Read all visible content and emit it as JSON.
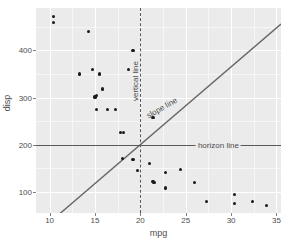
{
  "chart_data": {
    "type": "scatter",
    "title": "",
    "xlabel": "mpg",
    "ylabel": "disp",
    "xlim": [
      8.5,
      35.5
    ],
    "ylim": [
      55,
      490
    ],
    "grid": true,
    "legend": false,
    "x_ticks": [
      10,
      15,
      20,
      25,
      30,
      35
    ],
    "y_ticks": [
      100,
      200,
      300,
      400
    ],
    "x_minor_ticks": [
      12.5,
      17.5,
      22.5,
      27.5,
      32.5
    ],
    "y_minor_ticks": [
      150,
      250,
      350,
      450
    ],
    "points": [
      {
        "x": 10.4,
        "y": 472
      },
      {
        "x": 10.4,
        "y": 460
      },
      {
        "x": 14.3,
        "y": 440
      },
      {
        "x": 19.2,
        "y": 400
      },
      {
        "x": 13.3,
        "y": 350
      },
      {
        "x": 14.7,
        "y": 360
      },
      {
        "x": 15.5,
        "y": 350
      },
      {
        "x": 18.7,
        "y": 360
      },
      {
        "x": 15.2,
        "y": 304
      },
      {
        "x": 15.0,
        "y": 301
      },
      {
        "x": 15.2,
        "y": 275
      },
      {
        "x": 16.4,
        "y": 275
      },
      {
        "x": 17.3,
        "y": 275
      },
      {
        "x": 15.8,
        "y": 318
      },
      {
        "x": 21.4,
        "y": 258
      },
      {
        "x": 17.8,
        "y": 225
      },
      {
        "x": 18.1,
        "y": 225
      },
      {
        "x": 19.7,
        "y": 145
      },
      {
        "x": 21.0,
        "y": 160
      },
      {
        "x": 18.0,
        "y": 170
      },
      {
        "x": 19.2,
        "y": 168
      },
      {
        "x": 21.5,
        "y": 120
      },
      {
        "x": 21.4,
        "y": 121
      },
      {
        "x": 22.8,
        "y": 141
      },
      {
        "x": 22.8,
        "y": 108
      },
      {
        "x": 24.4,
        "y": 147
      },
      {
        "x": 26.0,
        "y": 120
      },
      {
        "x": 27.3,
        "y": 79
      },
      {
        "x": 30.4,
        "y": 95
      },
      {
        "x": 30.4,
        "y": 76
      },
      {
        "x": 32.4,
        "y": 79
      },
      {
        "x": 33.9,
        "y": 71
      }
    ],
    "reference_lines": [
      {
        "name": "horizon line",
        "type": "horizontal",
        "intercept": 200,
        "style": "solid",
        "color": "#595959",
        "label": "horizon line"
      },
      {
        "name": "vertical line",
        "type": "vertical",
        "xintercept": 20,
        "style": "dashed",
        "color": "#595959",
        "label": "vertical line"
      },
      {
        "name": "slope line",
        "type": "abline",
        "slope": 16.5,
        "intercept": -130,
        "style": "solid",
        "color": "#666666",
        "label": "slope line"
      }
    ],
    "annotations": [
      {
        "label": "vertical line",
        "x": 19.4,
        "y": 335,
        "rotation": 90
      },
      {
        "label": "slope line",
        "x": 22.4,
        "y": 278,
        "rotation": 30
      },
      {
        "label": "horizon line",
        "x": 28.6,
        "y": 200,
        "rotation": 0
      }
    ],
    "colors": {
      "panel_background": "#ebebeb",
      "grid_major": "#ffffff",
      "grid_minor": "#ffffff",
      "point": "#1a1a1a",
      "reference_line": "#595959",
      "slope_line": "#666666",
      "text": "#4d4d4d",
      "plot_background": "#ffffff"
    }
  }
}
